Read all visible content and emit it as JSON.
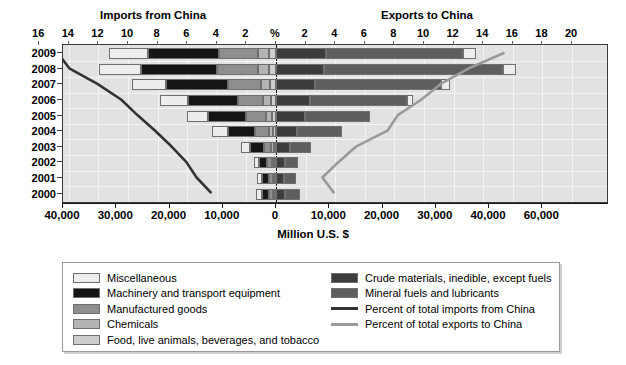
{
  "titles": {
    "imports": "Imports from China",
    "exports": "Exports to China",
    "axis_title": "Million U.S. $"
  },
  "pct_axis": {
    "labels": [
      "16",
      "14",
      "12",
      "10",
      "8",
      "6",
      "4",
      "2",
      "%",
      "2",
      "4",
      "6",
      "8",
      "10",
      "12",
      "14",
      "16",
      "18",
      "20"
    ]
  },
  "value_axis": {
    "labels": [
      "40,000",
      "30,000",
      "20,000",
      "10,000",
      "0",
      "10,000",
      "20,000",
      "30,000",
      "40,000",
      "60,000"
    ]
  },
  "legend": {
    "left": [
      {
        "label": "Miscellaneous",
        "color": "#ededed"
      },
      {
        "label": "Machinery and transport equipment",
        "color": "#151515"
      },
      {
        "label": "Manufactured goods",
        "color": "#8e8e8e"
      },
      {
        "label": "Chemicals",
        "color": "#b4b4b4"
      },
      {
        "label": "Food, live animals, beverages, and tobacco",
        "color": "#cdcdcd"
      }
    ],
    "right": [
      {
        "label": "Crude materials, inedible, except fuels",
        "color": "#3d3d3d"
      },
      {
        "label": "Mineral fuels and lubricants",
        "color": "#5e5e5e"
      },
      {
        "label": "Percent of total imports from China",
        "color": "#333333",
        "type": "line"
      },
      {
        "label": "Percent of total exports to China",
        "color": "#9a9a9a",
        "type": "line"
      }
    ]
  },
  "chart_data": {
    "type": "bar",
    "orientation": "horizontal-diverging",
    "xlabel": "Million U.S. $",
    "ylabel": "",
    "grid": true,
    "legend_position": "bottom",
    "categories": [
      "2009",
      "2008",
      "2007",
      "2006",
      "2005",
      "2004",
      "2003",
      "2002",
      "2001",
      "2000"
    ],
    "value_axis": {
      "left_side": "Imports from China",
      "right_side": "Exports to China",
      "ticks": [
        -40000,
        -30000,
        -20000,
        -10000,
        0,
        10000,
        20000,
        30000,
        40000,
        50000
      ],
      "tick_labels": [
        "40,000",
        "30,000",
        "20,000",
        "10,000",
        "0",
        "10,000",
        "20,000",
        "30,000",
        "40,000",
        "60,000"
      ],
      "xlim": [
        -42000,
        53000
      ]
    },
    "percent_axis": {
      "left_side_ticks": [
        16,
        14,
        12,
        10,
        8,
        6,
        4,
        2,
        0
      ],
      "right_side_ticks": [
        2,
        4,
        6,
        8,
        10,
        12,
        14,
        16,
        18,
        20
      ],
      "unit": "%"
    },
    "stacked_series": [
      {
        "name": "Miscellaneous",
        "color": "#ededed"
      },
      {
        "name": "Machinery and transport equipment",
        "color": "#151515"
      },
      {
        "name": "Manufactured goods",
        "color": "#8e8e8e"
      },
      {
        "name": "Chemicals",
        "color": "#b4b4b4"
      },
      {
        "name": "Food, live animals, beverages, and tobacco",
        "color": "#cdcdcd"
      },
      {
        "name": "Crude materials, inedible, except fuels",
        "color": "#3d3d3d"
      },
      {
        "name": "Mineral fuels and lubricants",
        "color": "#5e5e5e"
      }
    ],
    "imports_by_year": {
      "2009": {
        "Miscellaneous": 7200,
        "Machinery and transport equipment": 13400,
        "Manufactured goods": 7400,
        "Chemicals": 1900,
        "Food, live animals, beverages, and tobacco": 1400,
        "total": 31300
      },
      "2008": {
        "Miscellaneous": 8000,
        "Machinery and transport equipment": 14200,
        "Manufactured goods": 7700,
        "Chemicals": 2000,
        "Food, live animals, beverages, and tobacco": 1400,
        "total": 33300
      },
      "2007": {
        "Miscellaneous": 6400,
        "Machinery and transport equipment": 11600,
        "Manufactured goods": 6100,
        "Chemicals": 1700,
        "Food, live animals, beverages, and tobacco": 1200,
        "total": 27000
      },
      "2006": {
        "Miscellaneous": 5300,
        "Machinery and transport equipment": 9300,
        "Manufactured goods": 4800,
        "Chemicals": 1400,
        "Food, live animals, beverages, and tobacco": 1000,
        "total": 21800
      },
      "2005": {
        "Miscellaneous": 4100,
        "Machinery and transport equipment": 7100,
        "Manufactured goods": 3700,
        "Chemicals": 1100,
        "Food, live animals, beverages, and tobacco": 800,
        "total": 16800
      },
      "2004": {
        "Miscellaneous": 2900,
        "Machinery and transport equipment": 5100,
        "Manufactured goods": 2600,
        "Chemicals": 800,
        "Food, live animals, beverages, and tobacco": 600,
        "total": 12000
      },
      "2003": {
        "Miscellaneous": 1700,
        "Machinery and transport equipment": 2600,
        "Manufactured goods": 1400,
        "Chemicals": 500,
        "Food, live animals, beverages, and tobacco": 400,
        "total": 6600
      },
      "2002": {
        "Miscellaneous": 1100,
        "Machinery and transport equipment": 1500,
        "Manufactured goods": 900,
        "Chemicals": 400,
        "Food, live animals, beverages, and tobacco": 300,
        "total": 4200
      },
      "2001": {
        "Miscellaneous": 900,
        "Machinery and transport equipment": 1200,
        "Manufactured goods": 800,
        "Chemicals": 300,
        "Food, live animals, beverages, and tobacco": 300,
        "total": 3500
      },
      "2000": {
        "Miscellaneous": 1000,
        "Machinery and transport equipment": 1300,
        "Manufactured goods": 800,
        "Chemicals": 300,
        "Food, live animals, beverages, and tobacco": 300,
        "total": 3700
      }
    },
    "exports_by_year": {
      "2009": {
        "Crude materials, inedible, except fuels": 9400,
        "Mineral fuels and lubricants": 25700,
        "Miscellaneous": 2500,
        "total": 37600
      },
      "2008": {
        "Crude materials, inedible, except fuels": 9100,
        "Mineral fuels and lubricants": 33600,
        "Miscellaneous": 2300,
        "total": 45000
      },
      "2007": {
        "Crude materials, inedible, except fuels": 7400,
        "Mineral fuels and lubricants": 23600,
        "Miscellaneous": 1700,
        "total": 32700
      },
      "2006": {
        "Crude materials, inedible, except fuels": 6300,
        "Mineral fuels and lubricants": 18300,
        "Miscellaneous": 1100,
        "total": 25700
      },
      "2005": {
        "Crude materials, inedible, except fuels": 5400,
        "Mineral fuels and lubricants": 12200,
        "Miscellaneous": 0,
        "total": 17600
      },
      "2004": {
        "Crude materials, inedible, except fuels": 4000,
        "Mineral fuels and lubricants": 8400,
        "Miscellaneous": 0,
        "total": 12400
      },
      "2003": {
        "Crude materials, inedible, except fuels": 2600,
        "Mineral fuels and lubricants": 4000,
        "Miscellaneous": 0,
        "total": 6600
      },
      "2002": {
        "Crude materials, inedible, except fuels": 1600,
        "Mineral fuels and lubricants": 2600,
        "Miscellaneous": 0,
        "total": 4200
      },
      "2001": {
        "Crude materials, inedible, except fuels": 1500,
        "Mineral fuels and lubricants": 2300,
        "Miscellaneous": 0,
        "total": 3800
      },
      "2000": {
        "Crude materials, inedible, except fuels": 1700,
        "Mineral fuels and lubricants": 2800,
        "Miscellaneous": 0,
        "total": 4500
      }
    },
    "lines": [
      {
        "name": "Percent of total imports from China",
        "color": "#333333",
        "axis": "percent-left",
        "values": {
          "2009": 14.7,
          "2008": 13.9,
          "2007": 12.0,
          "2006": 10.4,
          "2005": 9.3,
          "2004": 8.1,
          "2003": 7.0,
          "2002": 6.0,
          "2001": 5.3,
          "2000": 4.3
        }
      },
      {
        "name": "Percent of total exports to China",
        "color": "#9a9a9a",
        "axis": "percent-right",
        "values": {
          "2009": 15.5,
          "2008": 13.1,
          "2007": 11.2,
          "2006": 9.9,
          "2005": 8.3,
          "2004": 7.6,
          "2003": 5.5,
          "2002": 4.3,
          "2001": 3.2,
          "2000": 4.0
        }
      }
    ]
  }
}
